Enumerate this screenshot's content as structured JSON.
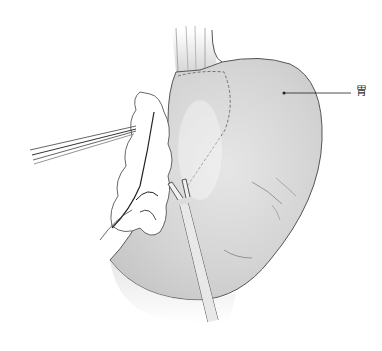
{
  "figure": {
    "labels": [
      {
        "text": "胃",
        "anchor": [
          284,
          93
        ]
      }
    ]
  },
  "icons": {
    "grasper": "grasper-forceps-icon",
    "clip": "clip-applier-icon"
  },
  "colors": {
    "outline": "#444444",
    "shade": "#cfcfcf",
    "background": "#ffffff"
  }
}
